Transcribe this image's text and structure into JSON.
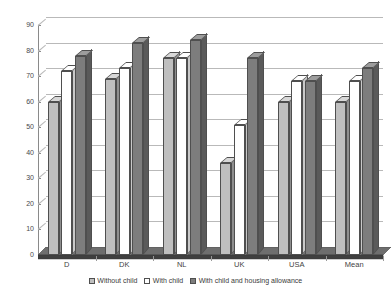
{
  "chart_data": {
    "type": "bar",
    "title": "",
    "subtitle": "",
    "xlabel": "",
    "ylabel": "",
    "categories": [
      "D",
      "DK",
      "NL",
      "UK",
      "USA",
      "Mean"
    ],
    "series": [
      {
        "name": "Without child",
        "values": [
          60,
          69,
          77,
          36,
          60,
          60
        ],
        "color": "#bfbfbf"
      },
      {
        "name": "With child",
        "values": [
          72,
          73,
          77,
          51,
          68,
          68
        ],
        "color": "#ffffff"
      },
      {
        "name": "With child and housing allowance",
        "values": [
          78,
          83,
          84,
          77,
          68,
          73
        ],
        "color": "#7d7d7d"
      }
    ],
    "ylim": [
      0,
      90
    ],
    "yticks": [
      0,
      10,
      20,
      30,
      40,
      50,
      60,
      70,
      80,
      90
    ],
    "ytick_labels": [
      "0",
      "10",
      "20",
      "30",
      "40",
      "50",
      "60",
      "70",
      "80",
      "90"
    ],
    "grid": true,
    "legend_position": "bottom",
    "style": "3d-column"
  },
  "legend": {
    "items": [
      {
        "label": "Without child"
      },
      {
        "label": "With child"
      },
      {
        "label": "With child and housing allowance"
      }
    ]
  }
}
